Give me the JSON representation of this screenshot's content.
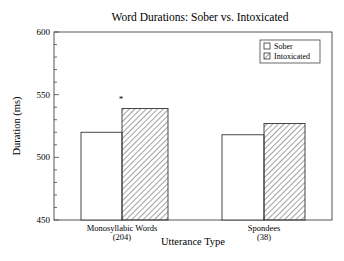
{
  "chart_data": {
    "type": "bar",
    "title": "Word Durations:  Sober vs. Intoxicated",
    "xlabel": "Utterance Type",
    "ylabel": "Duration (ms)",
    "ylim": [
      450,
      600
    ],
    "yticks": [
      450,
      500,
      550,
      600
    ],
    "yminor_step": 10,
    "grid": false,
    "legend_position": "upper right",
    "categories": [
      "Monosyllabic Words",
      "Spondees"
    ],
    "category_counts": [
      "(204)",
      "(38)"
    ],
    "series": [
      {
        "name": "Sober",
        "values": [
          520,
          518
        ],
        "pattern": "open"
      },
      {
        "name": "Intoxicated",
        "values": [
          539,
          527
        ],
        "pattern": "hatched"
      }
    ],
    "annotations": [
      {
        "text": "*",
        "category": "Monosyllabic Words",
        "note": "significance marker above bars"
      }
    ]
  },
  "colors": {
    "stroke": "#333333",
    "background": "#ffffff"
  }
}
